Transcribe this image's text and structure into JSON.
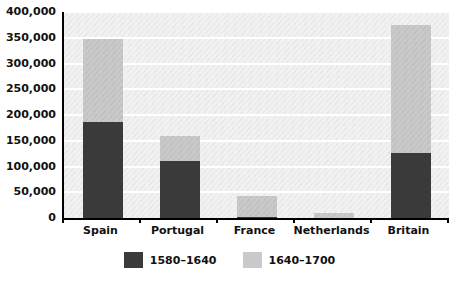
{
  "chart_data": {
    "type": "bar",
    "subtype": "stacked",
    "title": "",
    "xlabel": "",
    "ylabel": "",
    "ylim": [
      0,
      400000
    ],
    "ytick_step": 50000,
    "ytick_labels": [
      "400,000",
      "350,000",
      "300,000",
      "250,000",
      "200,000",
      "150,000",
      "100,000",
      "50,000",
      "0"
    ],
    "ytick_values": [
      400000,
      350000,
      300000,
      250000,
      200000,
      150000,
      100000,
      50000,
      0
    ],
    "grid": true,
    "grid_axis": "y",
    "legend_position": "bottom-center",
    "categories": [
      "Spain",
      "Portugal",
      "France",
      "Netherlands",
      "Britain"
    ],
    "series": [
      {
        "name": "1580–1640",
        "color": "#3a3a3a",
        "values": [
          187000,
          110000,
          2000,
          0,
          126000
        ]
      },
      {
        "name": "1640–1700",
        "color": "#c9c9c9",
        "values": [
          160000,
          50000,
          41000,
          10000,
          248000
        ]
      }
    ],
    "totals": [
      347000,
      160000,
      43000,
      10000,
      374000
    ]
  },
  "legend": {
    "items": [
      {
        "label": "1580–1640",
        "color": "#3a3a3a"
      },
      {
        "label": "1640–1700",
        "color": "#c9c9c9"
      }
    ]
  },
  "axes": {
    "y": {
      "ticks": [
        {
          "label": "400,000",
          "value": 400000
        },
        {
          "label": "350,000",
          "value": 350000
        },
        {
          "label": "300,000",
          "value": 300000
        },
        {
          "label": "250,000",
          "value": 250000
        },
        {
          "label": "200,000",
          "value": 200000
        },
        {
          "label": "150,000",
          "value": 150000
        },
        {
          "label": "100,000",
          "value": 100000
        },
        {
          "label": "50,000",
          "value": 50000
        },
        {
          "label": "0",
          "value": 0
        }
      ]
    },
    "x": {
      "ticks": [
        {
          "label": "Spain"
        },
        {
          "label": "Portugal"
        },
        {
          "label": "France"
        },
        {
          "label": "Netherlands"
        },
        {
          "label": "Britain"
        }
      ]
    }
  },
  "colors": {
    "panel_background": "#f1f1f1",
    "gridline": "#ffffff",
    "axis": "#000000",
    "series_dark": "#3a3a3a",
    "series_light": "#c9c9c9",
    "text": "#111111"
  }
}
